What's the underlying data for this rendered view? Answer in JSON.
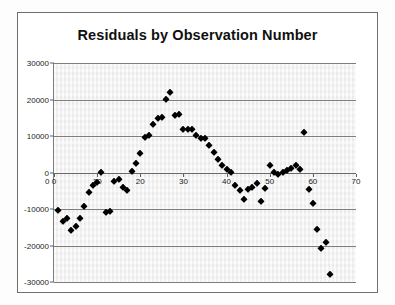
{
  "figure": {
    "title": "Residuals by Observation Number"
  },
  "chart_data": {
    "type": "scatter",
    "title": "Residuals by Observation Number",
    "xlabel": "",
    "ylabel": "",
    "xlim": [
      0,
      70
    ],
    "ylim": [
      -30000,
      30000
    ],
    "xticks": [
      0,
      10,
      20,
      30,
      40,
      50,
      60,
      70
    ],
    "ytick_labels": [
      "30000",
      "20000",
      "10000",
      "0",
      "-10000",
      "-20000",
      "-30000"
    ],
    "yticks": [
      30000,
      20000,
      10000,
      0,
      -10000,
      -20000,
      -30000
    ],
    "grid": "horizontal",
    "legend": "none",
    "marker": "diamond",
    "marker_color": "#000000",
    "plot_background": "#f1f1f1",
    "gridline_color": "#7e7e7e",
    "series": [
      {
        "name": "Residuals",
        "points": [
          [
            1,
            -10300
          ],
          [
            2,
            -13200
          ],
          [
            3,
            -12500
          ],
          [
            4,
            -15700
          ],
          [
            5,
            -14600
          ],
          [
            6,
            -12600
          ],
          [
            7,
            -9300
          ],
          [
            8,
            -5400
          ],
          [
            9,
            -3500
          ],
          [
            10,
            -2600
          ],
          [
            11,
            100
          ],
          [
            12,
            -10700
          ],
          [
            13,
            -10500
          ],
          [
            14,
            -2300
          ],
          [
            15,
            -1700
          ],
          [
            16,
            -3900
          ],
          [
            17,
            -4700
          ],
          [
            18,
            400
          ],
          [
            19,
            2600
          ],
          [
            20,
            5300
          ],
          [
            21,
            9800
          ],
          [
            22,
            10200
          ],
          [
            23,
            13400
          ],
          [
            24,
            14800
          ],
          [
            25,
            15100
          ],
          [
            26,
            20200
          ],
          [
            27,
            22100
          ],
          [
            28,
            15700
          ],
          [
            29,
            15900
          ],
          [
            30,
            11900
          ],
          [
            31,
            12000
          ],
          [
            32,
            11900
          ],
          [
            33,
            10400
          ],
          [
            34,
            9500
          ],
          [
            35,
            9400
          ],
          [
            36,
            7600
          ],
          [
            37,
            5700
          ],
          [
            38,
            3800
          ],
          [
            39,
            2000
          ],
          [
            40,
            900
          ],
          [
            41,
            200
          ],
          [
            42,
            -3500
          ],
          [
            43,
            -4700
          ],
          [
            44,
            -7200
          ],
          [
            45,
            -4400
          ],
          [
            46,
            -4100
          ],
          [
            47,
            -2900
          ],
          [
            48,
            -7700
          ],
          [
            49,
            -4300
          ],
          [
            50,
            2100
          ],
          [
            51,
            100
          ],
          [
            52,
            -300
          ],
          [
            53,
            200
          ],
          [
            54,
            700
          ],
          [
            55,
            1300
          ],
          [
            56,
            2100
          ],
          [
            57,
            900
          ],
          [
            58,
            11100
          ],
          [
            59,
            -4500
          ],
          [
            60,
            -8400
          ],
          [
            61,
            -15400
          ],
          [
            62,
            -20700
          ],
          [
            63,
            -19000
          ],
          [
            64,
            -27700
          ]
        ]
      }
    ]
  }
}
